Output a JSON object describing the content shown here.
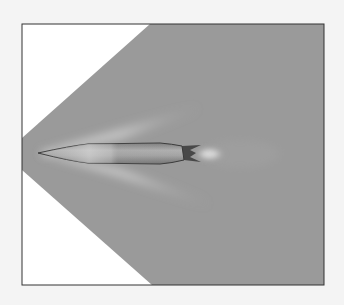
{
  "figure": {
    "colors": {
      "page_background": "#f4f4f4",
      "frame_inside_background": "#ffffff",
      "flow_field": "#9a9a9a",
      "frame_border": "#333333",
      "shock_highlight": "#d8d8d8",
      "projectile_body": "#a8a8a8",
      "projectile_outline": "#3a3a3a",
      "wake_highlight": "#ffffff"
    }
  }
}
